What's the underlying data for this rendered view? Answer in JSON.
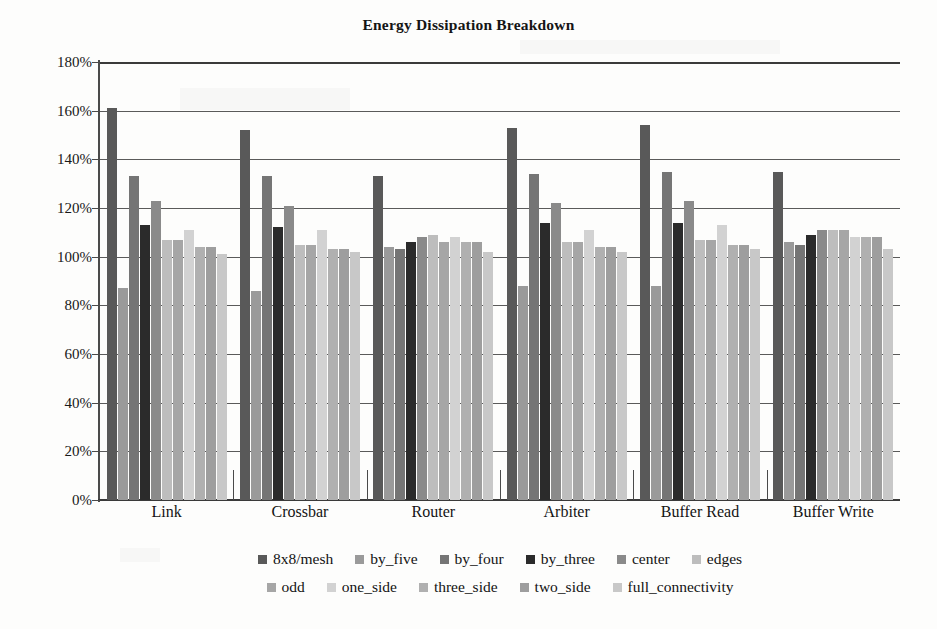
{
  "chart_data": {
    "type": "bar",
    "title": "Energy Dissipation Breakdown",
    "xlabel": "",
    "ylabel": "",
    "ylim": [
      0,
      180
    ],
    "ytick_step": 20,
    "ytick_labels": [
      "0%",
      "20%",
      "40%",
      "60%",
      "80%",
      "100%",
      "120%",
      "140%",
      "160%",
      "180%"
    ],
    "grid": true,
    "legend_position": "bottom",
    "categories": [
      "Link",
      "Crossbar",
      "Router",
      "Arbiter",
      "Buffer Read",
      "Buffer Write"
    ],
    "series": [
      {
        "name": "8x8/mesh",
        "color": "#595959",
        "values": [
          161,
          152,
          133,
          153,
          154,
          135
        ]
      },
      {
        "name": "by_five",
        "color": "#9a9a9a",
        "values": [
          87,
          86,
          104,
          88,
          88,
          106
        ]
      },
      {
        "name": "by_four",
        "color": "#757575",
        "values": [
          133,
          133,
          103,
          134,
          135,
          105
        ]
      },
      {
        "name": "by_three",
        "color": "#2b2b2b",
        "values": [
          113,
          112,
          106,
          114,
          114,
          109
        ]
      },
      {
        "name": "center",
        "color": "#8a8a8a",
        "values": [
          123,
          121,
          108,
          122,
          123,
          111
        ]
      },
      {
        "name": "edges",
        "color": "#bdbdbd",
        "values": [
          107,
          105,
          109,
          106,
          107,
          111
        ]
      },
      {
        "name": "odd",
        "color": "#a6a6a6",
        "values": [
          107,
          105,
          106,
          106,
          107,
          111
        ]
      },
      {
        "name": "one_side",
        "color": "#d2d2d2",
        "values": [
          111,
          111,
          108,
          111,
          113,
          108
        ]
      },
      {
        "name": "three_side",
        "color": "#b0b0b0",
        "values": [
          104,
          103,
          106,
          104,
          105,
          108
        ]
      },
      {
        "name": "two_side",
        "color": "#9e9e9e",
        "values": [
          104,
          103,
          106,
          104,
          105,
          108
        ]
      },
      {
        "name": "full_connectivity",
        "color": "#c8c8c8",
        "values": [
          101,
          102,
          102,
          102,
          103,
          103
        ]
      }
    ]
  },
  "legend": {
    "rows": [
      [
        "8x8/mesh",
        "by_five",
        "by_four",
        "by_three",
        "center",
        "edges"
      ],
      [
        "odd",
        "one_side",
        "three_side",
        "two_side",
        "full_connectivity"
      ]
    ]
  }
}
